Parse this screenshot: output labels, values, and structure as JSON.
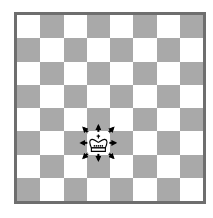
{
  "board": {
    "size": 8,
    "light_color": "#ffffff",
    "dark_color": "#a9a9a9",
    "border_color": "#6e6e6e"
  },
  "piece": {
    "type": "king",
    "color": "white",
    "icon": "king-icon",
    "col": 3,
    "row": 5
  },
  "arrows": {
    "icon": "arrow-icon",
    "color": "#000000",
    "directions": [
      "n",
      "ne",
      "e",
      "se",
      "s",
      "sw",
      "w",
      "nw"
    ]
  }
}
